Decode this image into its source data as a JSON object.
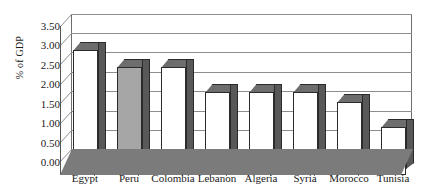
{
  "chart_data": {
    "type": "bar",
    "title": "",
    "xlabel": "",
    "ylabel": "% of GDP",
    "categories": [
      "Egypt",
      "Peru",
      "Colombia",
      "Lebanon",
      "Algeria",
      "Syria",
      "Morocco",
      "Tunisia"
    ],
    "values": [
      3.25,
      2.8,
      2.8,
      2.15,
      2.15,
      2.15,
      1.9,
      1.25
    ],
    "highlight_index": 1,
    "highlight_color": "#a6a6a6",
    "bar_color": "#ffffff",
    "bar_edge_color": "#2b2b2b",
    "ylim": [
      0,
      3.5
    ],
    "ytick_labels": [
      "0.00",
      "0.50",
      "1.00",
      "1.50",
      "2.00",
      "2.50",
      "3.00",
      "3.50"
    ],
    "ytick_values": [
      0,
      0.5,
      1.0,
      1.5,
      2.0,
      2.5,
      3.0,
      3.5
    ],
    "grid": true,
    "legend": null,
    "style": "3d-column"
  },
  "axis": {
    "y_title": "% of GDP"
  }
}
